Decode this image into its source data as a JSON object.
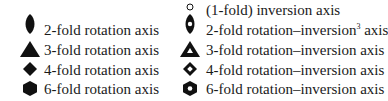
{
  "legend": {
    "left_column": [
      {
        "symbol": "filled-lens-icon",
        "label": "2-fold rotation axis"
      },
      {
        "symbol": "filled-triangle-icon",
        "label": "3-fold rotation axis"
      },
      {
        "symbol": "filled-diamond-icon",
        "label": "4-fold rotation axis"
      },
      {
        "symbol": "filled-hexagon-icon",
        "label": "6-fold rotation axis"
      }
    ],
    "right_column": [
      {
        "symbol": "open-circle-icon",
        "label": "(1-fold) inversion axis"
      },
      {
        "symbol": "lens-with-hole-icon",
        "label_pre": "2-fold rotation–inversion",
        "label_sup": "3",
        "label_post": " axis"
      },
      {
        "symbol": "triangle-with-hole-icon",
        "label": "3-fold rotation–inversion axis"
      },
      {
        "symbol": "diamond-with-hole-icon",
        "label": "4-fold rotation–inversion axis"
      },
      {
        "symbol": "hexagon-with-hole-icon",
        "label": "6-fold rotation–inversion axis"
      }
    ]
  }
}
